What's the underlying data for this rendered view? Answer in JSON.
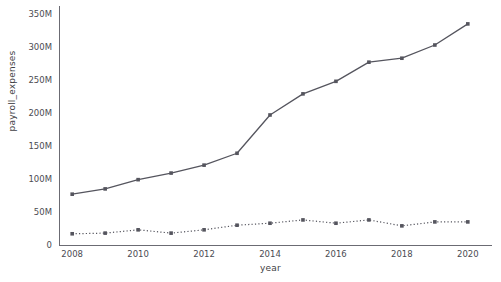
{
  "chart_data": {
    "type": "line",
    "title": "",
    "subtitle": "",
    "xlabel": "year",
    "ylabel": "payroll_expenses",
    "x": [
      2008,
      2009,
      2010,
      2011,
      2012,
      2013,
      2014,
      2015,
      2016,
      2017,
      2018,
      2019,
      2020
    ],
    "xlim": [
      2007.6,
      2020.4
    ],
    "ylim": [
      0,
      355000000
    ],
    "grid": false,
    "legend": "none",
    "xtick_labels": [
      "2008",
      "2010",
      "2012",
      "2014",
      "2016",
      "2018",
      "2020"
    ],
    "xtick_values": [
      2008,
      2010,
      2012,
      2014,
      2016,
      2018,
      2020
    ],
    "ytick_labels": [
      "0",
      "50M",
      "100M",
      "150M",
      "200M",
      "250M",
      "300M",
      "350M"
    ],
    "ytick_values": [
      0,
      50000000,
      100000000,
      150000000,
      200000000,
      250000000,
      300000000,
      350000000
    ],
    "series": [
      {
        "name": "upper-series",
        "linestyle": "solid",
        "marker": "square",
        "color": "#55555e",
        "values": [
          77000000,
          85000000,
          99000000,
          109000000,
          121000000,
          139000000,
          197000000,
          229000000,
          248000000,
          277000000,
          283000000,
          303000000,
          335000000
        ]
      },
      {
        "name": "lower-series",
        "linestyle": "dotted",
        "marker": "square",
        "color": "#55555e",
        "values": [
          17000000,
          18000000,
          23000000,
          18000000,
          23000000,
          30000000,
          33000000,
          38000000,
          33000000,
          38000000,
          29000000,
          35000000,
          35000000
        ]
      }
    ]
  },
  "axes": {
    "axis_color": "#6b6b73",
    "background": "#ffffff"
  }
}
